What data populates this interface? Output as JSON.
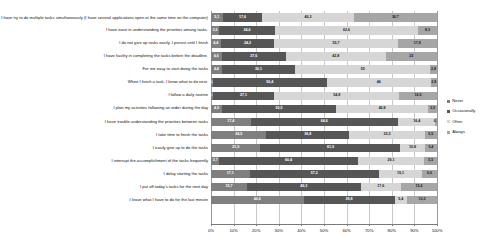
{
  "chart_data": {
    "type": "bar",
    "orientation": "horizontal",
    "stacked": true,
    "stacked_percent": true,
    "title": "",
    "xlabel": "",
    "ylabel": "",
    "xlim": [
      0,
      100
    ],
    "grid": true,
    "legend_position": "right",
    "xtick_labels": [
      "0%",
      "10%",
      "20%",
      "30%",
      "40%",
      "50%",
      "60%",
      "70%",
      "80%",
      "90%",
      "100%"
    ],
    "xticks": [
      0,
      10,
      20,
      30,
      40,
      50,
      60,
      70,
      80,
      90,
      100
    ],
    "series": [
      {
        "name": "Never",
        "color": "#7f7f7f"
      },
      {
        "name": "Occasionally",
        "color": "#565656"
      },
      {
        "name": "Often",
        "color": "#d6d6d6"
      },
      {
        "name": "Always",
        "color": "#a6a6a6"
      }
    ],
    "categories": [
      "I have try to do multiple tasks simultaneously (I have several applications open at the same time on the computer)",
      "I have ease in understanding the priorities among tasks.",
      "I do not give up tasks easily, I persist until I finish",
      "I have facility in completing the tasks before the deadline.",
      "For me easy to start doing the tasks",
      "When I finish a task, I know what to do next.",
      "I follow a daily routine",
      "I plan my activities following an order during the day",
      "I have trouble understanding the priorities between tasks",
      "I take time to finish the tasks",
      "I easily give up to do the tasks",
      "I interrupt the accomplishment of the tasks  frequently",
      "I delay starting the tasks",
      "I put off today's tasks for the next day",
      "I leave what I have to do for the last minute"
    ],
    "rows": [
      {
        "category": "I have try to do multiple tasks simultaneously (I have several applications open at the same time on the computer)",
        "values": [
          5.1,
          17.6,
          40.3,
          36.7
        ],
        "labels": [
          "5,1",
          "17,6",
          "40,3",
          "36,7"
        ]
      },
      {
        "category": "I have ease in understanding the priorities among tasks.",
        "values": [
          3.5,
          24.6,
          62.6,
          8.3
        ],
        "labels": [
          "3,5",
          "24,6",
          "62,6",
          "8,3"
        ]
      },
      {
        "category": "I do not give up tasks easily, I persist until I finish",
        "values": [
          4.4,
          24.2,
          55.7,
          17.8
        ],
        "labels": [
          "4,4",
          "24,2",
          "55,7",
          "17,8"
        ]
      },
      {
        "category": "I have facility in completing the tasks before the deadline.",
        "values": [
          4.6,
          27.6,
          42.8,
          22.0
        ],
        "labels": [
          "4,6",
          "27,6",
          "42,8",
          "22"
        ]
      },
      {
        "category": "For me easy to start doing the tasks",
        "values": [
          4.4,
          30.1,
          55.0,
          2.8
        ],
        "labels": [
          "4,4",
          "30,1",
          "55",
          "2,8"
        ]
      },
      {
        "category": "When I finish a task, I know what to do next.",
        "values": [
          0.8,
          50.4,
          46.0,
          2.8
        ],
        "labels": [
          "0,8",
          "50,4",
          "46",
          "2,8"
        ]
      },
      {
        "category": "I follow a daily routine",
        "values": [
          0.7,
          27.1,
          54.8,
          16.6
        ],
        "labels": [
          "0,7",
          "27,1",
          "54,8",
          "16,6"
        ]
      },
      {
        "category": "I plan my activities following an order during the day",
        "values": [
          4.9,
          50.5,
          40.8,
          3.9
        ],
        "labels": [
          "4,9",
          "50,5",
          "40,8",
          "3,9"
        ]
      },
      {
        "category": "I have trouble understanding the priorities between tasks",
        "values": [
          17.4,
          64.6,
          16.4,
          0.7
        ],
        "labels": [
          "17,4",
          "64,6",
          "16,4",
          "0,7"
        ]
      },
      {
        "category": "I take time to finish the tasks",
        "values": [
          24.5,
          36.8,
          33.3,
          5.5
        ],
        "labels": [
          "24,5",
          "36,8",
          "33,3",
          "5,5"
        ]
      },
      {
        "category": "I easily give up to do the tasks",
        "values": [
          21.9,
          61.9,
          10.8,
          5.4
        ],
        "labels": [
          "21,9",
          "61,9",
          "10,8",
          "5,4"
        ]
      },
      {
        "category": "I interrupt the accomplishment of the tasks  frequently",
        "values": [
          3.7,
          60.4,
          29.1,
          5.5
        ],
        "labels": [
          "3,7",
          "60,4",
          "29,1",
          "5,5"
        ]
      },
      {
        "category": "I delay starting the tasks",
        "values": [
          17.1,
          57.2,
          19.1,
          6.6
        ],
        "labels": [
          "17,1",
          "57,2",
          "19,1",
          "6,6"
        ]
      },
      {
        "category": "I put off today's tasks for the next day",
        "values": [
          15.7,
          49.3,
          17.6,
          15.6
        ],
        "labels": [
          "15,7",
          "49,3",
          "17,6",
          "15,6"
        ]
      },
      {
        "category": "I leave what I have to do for the last minute",
        "values": [
          40.6,
          39.8,
          5.4,
          13.2
        ],
        "labels": [
          "40,6",
          "39,8",
          "5,4",
          "13,2"
        ]
      }
    ]
  },
  "legend": {
    "items": [
      {
        "label": "Never"
      },
      {
        "label": "Occasionally"
      },
      {
        "label": "Often"
      },
      {
        "label": "Always"
      }
    ]
  }
}
